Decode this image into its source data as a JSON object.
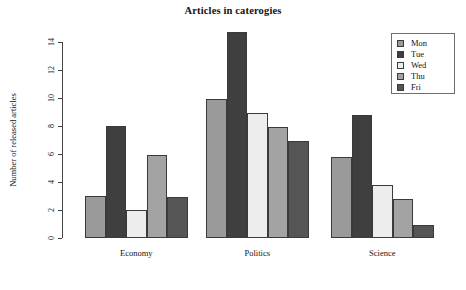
{
  "chart_data": {
    "type": "bar",
    "title": "Articles in caterogies",
    "xlabel": "",
    "ylabel": "Number of released articles",
    "categories": [
      "Economy",
      "Politics",
      "Science"
    ],
    "series": [
      {
        "name": "Mon",
        "color": "#9a9a9a",
        "values": [
          3.0,
          9.9,
          5.8
        ]
      },
      {
        "name": "Tue",
        "color": "#3f3f3f",
        "values": [
          8.0,
          14.7,
          8.8
        ]
      },
      {
        "name": "Wed",
        "color": "#ededed",
        "values": [
          2.0,
          8.9,
          3.8
        ]
      },
      {
        "name": "Thu",
        "color": "#a3a3a3",
        "values": [
          5.9,
          7.9,
          2.8
        ]
      },
      {
        "name": "Fri",
        "color": "#555555",
        "values": [
          2.9,
          6.9,
          0.9
        ]
      }
    ],
    "ylim": [
      0,
      14
    ],
    "yticks": [
      "0",
      "2",
      "4",
      "6",
      "8",
      "10",
      "12",
      "14"
    ],
    "grid": false,
    "legend_position": "top-right",
    "legend_entries": [
      "Mon",
      "Tue",
      "Wed",
      "Thu",
      "Fri"
    ]
  },
  "legend": {
    "items": [
      {
        "label": "Mon"
      },
      {
        "label": "Tue"
      },
      {
        "label": "Wed"
      },
      {
        "label": "Thu"
      },
      {
        "label": "Fri"
      }
    ]
  }
}
